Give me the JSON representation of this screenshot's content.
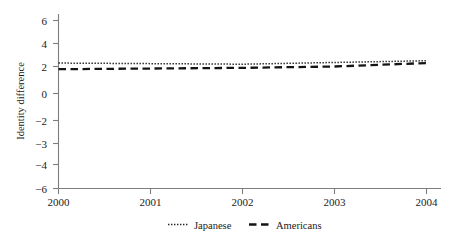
{
  "chart_data": {
    "type": "line",
    "title": "",
    "xlabel": "",
    "ylabel": "Identity difference",
    "x": [
      2000,
      2001,
      2002,
      2003,
      2004
    ],
    "xtick_labels": [
      "2000",
      "2001",
      "2002",
      "2003",
      "2004"
    ],
    "ytick_labels": [
      "6",
      "4",
      "2",
      "0",
      "−2",
      "−3",
      "−4",
      "−6"
    ],
    "ytick_values": [
      6,
      4,
      2,
      0,
      -2,
      -3,
      -4,
      -6
    ],
    "ylim": [
      -6,
      7
    ],
    "xlim": [
      2000,
      2004
    ],
    "grid": false,
    "legend_position": "bottom",
    "series": [
      {
        "name": "Japanese",
        "style": "dotted",
        "values": [
          2.3,
          2.25,
          2.2,
          2.35,
          2.5
        ]
      },
      {
        "name": "Americans",
        "style": "dashed",
        "values": [
          1.8,
          1.85,
          1.9,
          2.0,
          2.3
        ]
      }
    ]
  },
  "axes": {
    "y_title": "Identity difference",
    "y_ticks": [
      {
        "label": "6",
        "value": 6
      },
      {
        "label": "4",
        "value": 4
      },
      {
        "label": "2",
        "value": 2
      },
      {
        "label": "0",
        "value": 0
      },
      {
        "label": "−2",
        "value": -2
      },
      {
        "label": "−3",
        "value": -3
      },
      {
        "label": "−4",
        "value": -4
      },
      {
        "label": "−6",
        "value": -6
      }
    ],
    "x_ticks": [
      {
        "label": "2000",
        "value": 2000
      },
      {
        "label": "2001",
        "value": 2001
      },
      {
        "label": "2002",
        "value": 2002
      },
      {
        "label": "2003",
        "value": 2003
      },
      {
        "label": "2004",
        "value": 2004
      }
    ]
  },
  "legend": {
    "items": [
      {
        "label": "Japanese",
        "style": "dotted"
      },
      {
        "label": "Americans",
        "style": "dashed"
      }
    ]
  },
  "colors": {
    "axis": "#7d7d7d",
    "japanese": "#222222",
    "americans": "#141414",
    "background": "#ffffff"
  }
}
